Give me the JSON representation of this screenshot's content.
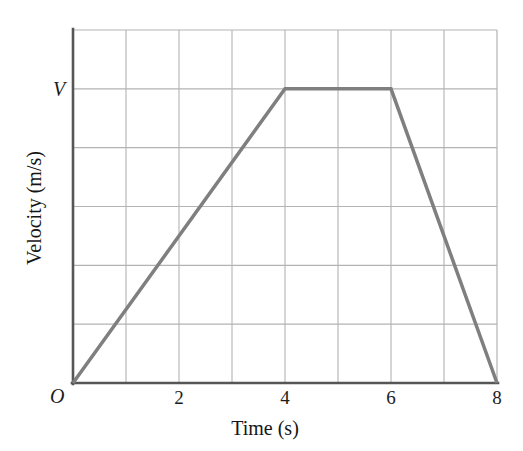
{
  "chart_data": {
    "type": "line",
    "title": "",
    "xlabel": "Time (s)",
    "ylabel": "Velocity (m/s)",
    "origin_label": "O",
    "xlim": [
      0,
      8
    ],
    "ylim": [
      0,
      6
    ],
    "x_ticks": [
      2,
      4,
      6,
      8
    ],
    "x_tick_labels": [
      "2",
      "4",
      "6",
      "8"
    ],
    "y_ticks": [
      5
    ],
    "y_tick_labels": [
      "V"
    ],
    "grid": true,
    "grid_x_step": 1,
    "grid_y_step": 1,
    "legend": "none",
    "series": [
      {
        "name": "velocity",
        "x": [
          0,
          4,
          6,
          8
        ],
        "y": [
          0,
          5,
          5,
          0
        ],
        "color": "#7f7f7f",
        "line_width": 3.5
      }
    ],
    "annotations": [
      {
        "text": "V",
        "x": 0,
        "y": 5,
        "style": "italic",
        "placement": "y-axis-tick"
      },
      {
        "text": "O",
        "x": 0,
        "y": 0,
        "style": "italic",
        "placement": "origin"
      }
    ]
  },
  "axes": {
    "frame_color": "#5a5a5a",
    "grid_color": "#b3b3b3",
    "background": "#ffffff"
  },
  "ticks": {
    "x": [
      {
        "label": "2",
        "value": 2
      },
      {
        "label": "4",
        "value": 4
      },
      {
        "label": "6",
        "value": 6
      },
      {
        "label": "8",
        "value": 8
      }
    ],
    "y": [
      {
        "label": "V",
        "value": 5
      }
    ]
  },
  "labels": {
    "x_title": "Time (s)",
    "y_title": "Velocity (m/s)",
    "origin": "O"
  }
}
